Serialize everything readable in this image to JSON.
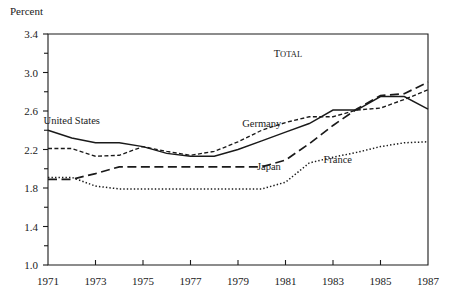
{
  "chart_data": {
    "type": "line",
    "title": "",
    "annotations": [
      {
        "text": "T",
        "rest": "OTAL",
        "x": 1981.1,
        "y": 3.16,
        "style": "small-caps"
      }
    ],
    "ylabel": "Percent",
    "xlabel": "",
    "ylim": [
      1.0,
      3.4
    ],
    "xlim": [
      1971,
      1987
    ],
    "yticks": [
      1.0,
      1.4,
      1.8,
      2.2,
      2.6,
      3.0,
      3.4
    ],
    "ytick_labels": [
      "1.0",
      "1.4",
      "1.8",
      "2.2",
      "2.6",
      "3.0",
      "3.4"
    ],
    "yticks_minor": [
      1.2,
      1.6,
      2.0,
      2.4,
      2.8,
      3.2
    ],
    "xticks": [
      1971,
      1973,
      1975,
      1977,
      1979,
      1981,
      1983,
      1985,
      1987
    ],
    "xtick_labels": [
      "1971",
      "1973",
      "1975",
      "1977",
      "1979",
      "1981",
      "1983",
      "1985",
      "1987"
    ],
    "grid": false,
    "legend_position": "inline-annotations",
    "x": [
      1971,
      1972,
      1973,
      1974,
      1975,
      1976,
      1977,
      1978,
      1979,
      1980,
      1981,
      1982,
      1983,
      1984,
      1985,
      1986,
      1987
    ],
    "series": [
      {
        "name": "United States",
        "dash": "solid",
        "label_x": 1972.0,
        "label_y": 2.46,
        "values": [
          2.4,
          2.32,
          2.27,
          2.27,
          2.23,
          2.16,
          2.13,
          2.13,
          2.2,
          2.29,
          2.38,
          2.47,
          2.61,
          2.61,
          2.75,
          2.75,
          2.62
        ]
      },
      {
        "name": "Germany",
        "dash": "short-dash",
        "label_x": 1980.0,
        "label_y": 2.43,
        "values": [
          2.21,
          2.21,
          2.13,
          2.14,
          2.23,
          2.18,
          2.14,
          2.18,
          2.28,
          2.4,
          2.48,
          2.54,
          2.54,
          2.61,
          2.63,
          2.72,
          2.82
        ]
      },
      {
        "name": "Japan",
        "dash": "long-dash",
        "label_x": 1980.3,
        "label_y": 1.99,
        "values": [
          1.89,
          1.89,
          1.95,
          2.02,
          2.02,
          2.02,
          2.02,
          2.02,
          2.02,
          2.02,
          2.09,
          2.26,
          2.45,
          2.62,
          2.76,
          2.78,
          2.9
        ]
      },
      {
        "name": "France",
        "dash": "dotted",
        "label_x": 1983.2,
        "label_y": 2.06,
        "values": [
          1.91,
          1.91,
          1.82,
          1.79,
          1.79,
          1.79,
          1.79,
          1.79,
          1.79,
          1.79,
          1.86,
          2.06,
          2.12,
          2.17,
          2.23,
          2.27,
          2.28
        ]
      }
    ]
  }
}
